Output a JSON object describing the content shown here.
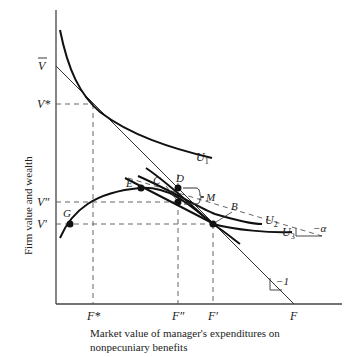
{
  "diagram": {
    "y_axis_label": "Firm value and wealth",
    "x_axis_caption_line1": "Market value of manager's expenditures on",
    "x_axis_caption_line2": "nonpecuniary benefits",
    "y_ticks": {
      "v_bar": "V",
      "v_star": "V*",
      "v_double_prime": "V″",
      "v_prime": "V′"
    },
    "x_ticks": {
      "f_star": "F*",
      "f_double_prime": "F″",
      "f_prime": "F′",
      "f": "F"
    },
    "curve_labels": {
      "u1": "U",
      "u1_sub": "1",
      "u2": "U",
      "u2_sub": "2",
      "u3": "U",
      "u3_sub": "3"
    },
    "point_labels": {
      "b": "B",
      "c": "C",
      "d": "D",
      "e": "E",
      "g": "G",
      "m": "M"
    },
    "slope_labels": {
      "minus_alpha": "−α",
      "minus_one": "−1"
    },
    "colors": {
      "ink": "#222222",
      "background": "#ffffff"
    }
  }
}
